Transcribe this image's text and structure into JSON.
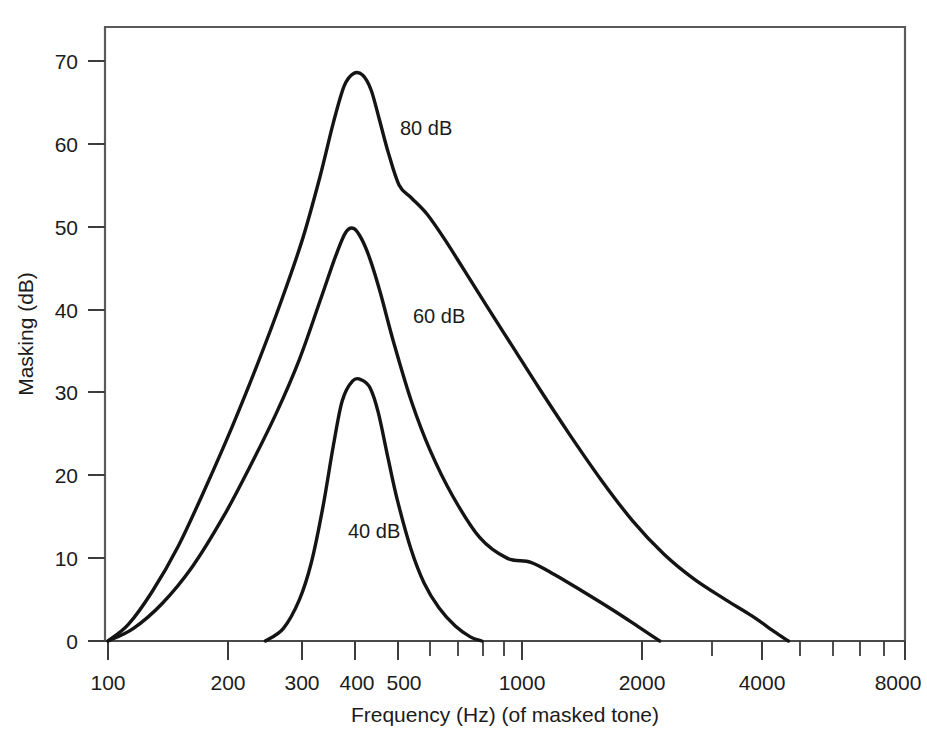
{
  "figure": {
    "background_color": "#ffffff",
    "frame_color": "#5a5a5a",
    "curve_color": "#141414",
    "text_color": "#1b1b1b"
  },
  "axes": {
    "x_title": "Frequency (Hz) (of masked tone)",
    "y_title": "Masking (dB)",
    "x_tick_labels": [
      "100",
      "200",
      "300",
      "400",
      "500",
      "1000",
      "2000",
      "4000",
      "8000"
    ],
    "y_tick_labels": [
      "0",
      "10",
      "20",
      "30",
      "40",
      "50",
      "60",
      "70"
    ]
  },
  "curve_labels": {
    "low": "40 dB",
    "mid": "60 dB",
    "high": "80 dB"
  },
  "chart_data": {
    "type": "line",
    "title": "",
    "subtitle": "",
    "xlabel": "Frequency (Hz) (of masked tone)",
    "ylabel": "Masking (dB)",
    "xscale": "log",
    "yscale": "linear",
    "xlim": [
      100,
      8000
    ],
    "ylim": [
      0,
      75
    ],
    "x_ticks": [
      100,
      200,
      300,
      400,
      500,
      1000,
      2000,
      4000,
      8000
    ],
    "x_tick_labels": [
      "100",
      "200",
      "300",
      "400",
      "500",
      "1000",
      "2000",
      "4000",
      "8000"
    ],
    "x_minor_ticks": [
      600,
      700,
      800,
      900,
      3000,
      5000,
      6000,
      7000
    ],
    "y_ticks": [
      0,
      10,
      20,
      30,
      40,
      50,
      60,
      70
    ],
    "y_tick_labels": [
      "0",
      "10",
      "20",
      "30",
      "40",
      "50",
      "60",
      "70"
    ],
    "grid": false,
    "legend": "inline-annotations",
    "legend_position": "inline",
    "annotations": [
      {
        "text": "80 dB",
        "x": 560,
        "y": 61
      },
      {
        "text": "60 dB",
        "x": 500,
        "y": 39
      },
      {
        "text": "40 dB",
        "x": 340,
        "y": 14
      }
    ],
    "series": [
      {
        "name": "40 dB",
        "label": "40 dB",
        "masker_level_db": 40,
        "peak_frequency_hz": 400,
        "peak_masking_db": 31.5,
        "onset_frequency_hz": 240,
        "offset_frequency_hz": 800,
        "points": [
          {
            "x": 240,
            "y": 0.0
          },
          {
            "x": 265,
            "y": 1.5
          },
          {
            "x": 290,
            "y": 5.0
          },
          {
            "x": 310,
            "y": 9.5
          },
          {
            "x": 330,
            "y": 16.0
          },
          {
            "x": 350,
            "y": 23.5
          },
          {
            "x": 368,
            "y": 29.0
          },
          {
            "x": 390,
            "y": 31.4
          },
          {
            "x": 410,
            "y": 31.5
          },
          {
            "x": 430,
            "y": 30.5
          },
          {
            "x": 450,
            "y": 27.5
          },
          {
            "x": 475,
            "y": 22.0
          },
          {
            "x": 500,
            "y": 17.0
          },
          {
            "x": 540,
            "y": 11.0
          },
          {
            "x": 580,
            "y": 7.0
          },
          {
            "x": 630,
            "y": 4.0
          },
          {
            "x": 690,
            "y": 1.8
          },
          {
            "x": 750,
            "y": 0.5
          },
          {
            "x": 800,
            "y": 0.0
          }
        ]
      },
      {
        "name": "60 dB",
        "label": "60 dB",
        "masker_level_db": 60,
        "peak_frequency_hz": 390,
        "peak_masking_db": 49.8,
        "onset_frequency_hz": 100,
        "offset_frequency_hz": 2150,
        "points": [
          {
            "x": 100,
            "y": 0.0
          },
          {
            "x": 115,
            "y": 1.5
          },
          {
            "x": 135,
            "y": 4.5
          },
          {
            "x": 160,
            "y": 9.0
          },
          {
            "x": 190,
            "y": 15.0
          },
          {
            "x": 220,
            "y": 21.0
          },
          {
            "x": 255,
            "y": 27.5
          },
          {
            "x": 290,
            "y": 34.0
          },
          {
            "x": 325,
            "y": 41.0
          },
          {
            "x": 355,
            "y": 46.5
          },
          {
            "x": 375,
            "y": 49.3
          },
          {
            "x": 392,
            "y": 49.8
          },
          {
            "x": 410,
            "y": 48.5
          },
          {
            "x": 430,
            "y": 46.0
          },
          {
            "x": 455,
            "y": 42.0
          },
          {
            "x": 490,
            "y": 36.0
          },
          {
            "x": 540,
            "y": 29.0
          },
          {
            "x": 600,
            "y": 23.0
          },
          {
            "x": 680,
            "y": 17.5
          },
          {
            "x": 790,
            "y": 12.5
          },
          {
            "x": 920,
            "y": 10.0
          },
          {
            "x": 1050,
            "y": 9.5
          },
          {
            "x": 1200,
            "y": 8.0
          },
          {
            "x": 1400,
            "y": 6.0
          },
          {
            "x": 1650,
            "y": 3.8
          },
          {
            "x": 1900,
            "y": 1.8
          },
          {
            "x": 2150,
            "y": 0.0
          }
        ]
      },
      {
        "name": "80 dB",
        "label": "80 dB",
        "masker_level_db": 80,
        "peak_frequency_hz": 400,
        "peak_masking_db": 68.5,
        "onset_frequency_hz": 100,
        "offset_frequency_hz": 4400,
        "shoulder_frequency_hz": 540,
        "shoulder_masking_db": 53.5,
        "points": [
          {
            "x": 100,
            "y": 0.0
          },
          {
            "x": 112,
            "y": 2.0
          },
          {
            "x": 128,
            "y": 6.0
          },
          {
            "x": 148,
            "y": 11.5
          },
          {
            "x": 172,
            "y": 18.5
          },
          {
            "x": 200,
            "y": 26.0
          },
          {
            "x": 230,
            "y": 33.5
          },
          {
            "x": 262,
            "y": 41.0
          },
          {
            "x": 295,
            "y": 48.5
          },
          {
            "x": 325,
            "y": 56.0
          },
          {
            "x": 350,
            "y": 62.5
          },
          {
            "x": 372,
            "y": 67.0
          },
          {
            "x": 392,
            "y": 68.5
          },
          {
            "x": 412,
            "y": 68.3
          },
          {
            "x": 432,
            "y": 66.5
          },
          {
            "x": 452,
            "y": 63.0
          },
          {
            "x": 475,
            "y": 59.0
          },
          {
            "x": 505,
            "y": 55.0
          },
          {
            "x": 540,
            "y": 53.5
          },
          {
            "x": 590,
            "y": 51.5
          },
          {
            "x": 650,
            "y": 48.5
          },
          {
            "x": 720,
            "y": 45.0
          },
          {
            "x": 820,
            "y": 40.5
          },
          {
            "x": 950,
            "y": 35.5
          },
          {
            "x": 1100,
            "y": 30.5
          },
          {
            "x": 1300,
            "y": 25.0
          },
          {
            "x": 1550,
            "y": 19.5
          },
          {
            "x": 1850,
            "y": 14.5
          },
          {
            "x": 2200,
            "y": 10.5
          },
          {
            "x": 2600,
            "y": 7.5
          },
          {
            "x": 3100,
            "y": 5.0
          },
          {
            "x": 3600,
            "y": 3.0
          },
          {
            "x": 4050,
            "y": 1.2
          },
          {
            "x": 4400,
            "y": 0.0
          }
        ]
      }
    ]
  }
}
